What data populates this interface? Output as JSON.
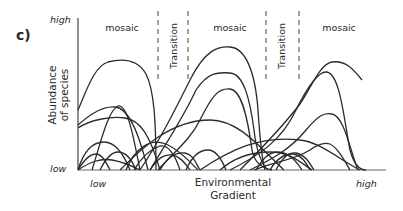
{
  "figure": {
    "panel_label": "c)",
    "y_axis": {
      "label_line1": "Abundance",
      "label_line2": "of species",
      "high_label": "high",
      "low_label": "low"
    },
    "x_axis": {
      "label_line1": "Environmental",
      "label_line2": "Gradient",
      "low_label": "low",
      "high_label": "high"
    },
    "zones": [
      {
        "type": "mosaic",
        "label": "mosaic"
      },
      {
        "type": "transition",
        "label": "Transition"
      },
      {
        "type": "mosaic",
        "label": "mosaic"
      },
      {
        "type": "transition",
        "label": "Transition"
      },
      {
        "type": "mosaic",
        "label": "mosaic"
      }
    ],
    "colors": {
      "curves": "#2b2b2b",
      "axis": "#444444",
      "x_axis_line": "#9a9a9a",
      "dashes": "#555555",
      "background": "#ffffff"
    }
  }
}
